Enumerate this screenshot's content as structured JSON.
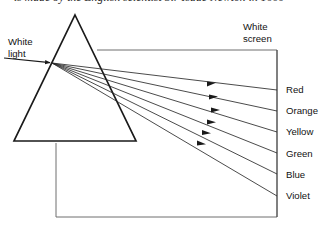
{
  "figure": {
    "caption": "is made by the English scientist Sir Isaac Newton in 1666",
    "type": "physics-optics-diagram"
  },
  "labels": {
    "source_line1": "White",
    "source_line2": "light",
    "screen_line1": "White",
    "screen_line2": "screen"
  },
  "spectrum": {
    "colors": [
      {
        "name": "Red",
        "screen_y": 90,
        "label_y": 84
      },
      {
        "name": "Orange",
        "screen_y": 111,
        "label_y": 105
      },
      {
        "name": "Yellow",
        "screen_y": 132,
        "label_y": 126
      },
      {
        "name": "Green",
        "screen_y": 153,
        "label_y": 148
      },
      {
        "name": "Blue",
        "screen_y": 174,
        "label_y": 169
      },
      {
        "name": "Violet",
        "screen_y": 196,
        "label_y": 190
      }
    ]
  },
  "geometry": {
    "prism": {
      "apex_x": 75,
      "apex_y": 15,
      "base_left_x": 14,
      "base_right_x": 136,
      "base_y": 141
    },
    "refraction_point": {
      "x": 52,
      "y": 63
    },
    "incident_ray": {
      "start_x": 4,
      "start_y": 58,
      "arrow_x": 44,
      "arrow_y": 62
    },
    "screen": {
      "x": 277,
      "top_y": 50,
      "bottom_y": 217
    },
    "top_rail": {
      "x1": 97,
      "x2": 277,
      "y": 50
    },
    "base_box": {
      "left_x": 56,
      "right_x": 277,
      "top_y": 143,
      "bottom_y": 217
    }
  },
  "style": {
    "stroke": "#1a1a1a",
    "stroke_light": "#6e6e6e",
    "background": "#ffffff"
  }
}
